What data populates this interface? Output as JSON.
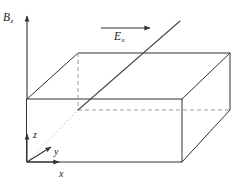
{
  "figure": {
    "type": "3d-box-diagram",
    "background": "#ffffff",
    "line_color": "#333333",
    "dashed_color": "#999999",
    "dotted_color": "#bbbbbb"
  },
  "labels": {
    "b_field": {
      "symbol": "B",
      "subscript": "z"
    },
    "e_field": {
      "symbol": "E",
      "subscript": "x"
    },
    "axis_x": {
      "symbol": "x"
    },
    "axis_y": {
      "symbol": "y"
    },
    "axis_z": {
      "symbol": "z"
    }
  },
  "geometry": {
    "box": {
      "front_top_left": [
        27,
        99
      ],
      "front_top_right": [
        182,
        99
      ],
      "front_bottom_left": [
        27,
        162
      ],
      "front_bottom_right": [
        182,
        162
      ],
      "back_top_left": [
        78,
        53
      ],
      "back_top_right": [
        230,
        53
      ],
      "back_bottom_right": [
        230,
        110
      ],
      "hidden_back_bottom_left": [
        78,
        110
      ]
    },
    "field_arrows": {
      "b_z": {
        "from": [
          27,
          99
        ],
        "to": [
          27,
          14
        ],
        "direction": "up"
      },
      "e_x": {
        "from": [
          101,
          28
        ],
        "to": [
          152,
          28
        ],
        "direction": "right"
      }
    },
    "axes": {
      "origin": [
        27,
        162
      ],
      "x_arrow_to": [
        61,
        162
      ],
      "y_arrow_to": [
        52,
        146
      ],
      "z_arrow_to": [
        27,
        132
      ]
    },
    "diagonal_line": {
      "from": [
        78,
        110
      ],
      "to": [
        180,
        21
      ]
    }
  }
}
